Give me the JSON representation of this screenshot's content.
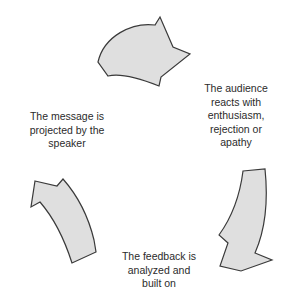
{
  "diagram": {
    "type": "cyclical-process",
    "direction": "clockwise",
    "background_color": "#ffffff",
    "arrow_fill_color": "#dfdfdf",
    "arrow_stroke_color": "#3a3a3a",
    "text_color": "#2b2b2b",
    "stages": [
      {
        "id": "message",
        "label": "The message is\nprojected by the\nspeaker",
        "position": "left",
        "arrow_name": "curved-arrow-left-up"
      },
      {
        "id": "audience",
        "label": "The audience\nreacts with\nenthusiasm,\nrejection or\napathy",
        "position": "right",
        "arrow_name": "curved-arrow-top-right"
      },
      {
        "id": "feedback",
        "label": "The feedback is\nanalyzed and\nbuilt on",
        "position": "bottom",
        "arrow_name": "curved-arrow-right-down"
      }
    ],
    "arrows": [
      {
        "id": "arrow-top",
        "points_toward": "audience"
      },
      {
        "id": "arrow-right",
        "points_toward": "feedback"
      },
      {
        "id": "arrow-left",
        "points_toward": "message"
      }
    ]
  }
}
